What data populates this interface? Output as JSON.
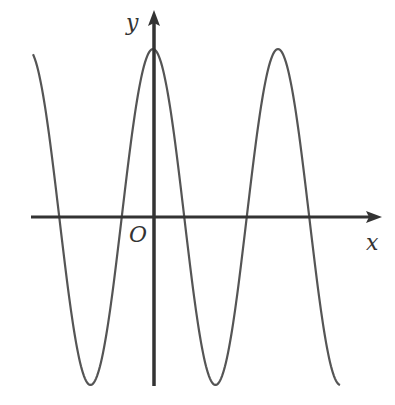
{
  "diagram": {
    "type": "function-graph",
    "labels": {
      "x_axis": "x",
      "y_axis": "y",
      "origin": "O"
    },
    "colors": {
      "curve": "#555555",
      "axis": "#333333",
      "background": "#ffffff"
    },
    "curve": {
      "amplitude_px": 168,
      "period_px": 125,
      "peak_x_px": [
        153,
        278
      ],
      "trough_x_px": [
        92,
        215,
        340
      ],
      "zero_crossings_px": [
        60,
        122,
        184,
        247,
        309
      ],
      "x_start_px": 33,
      "x_end_px": 340
    }
  }
}
